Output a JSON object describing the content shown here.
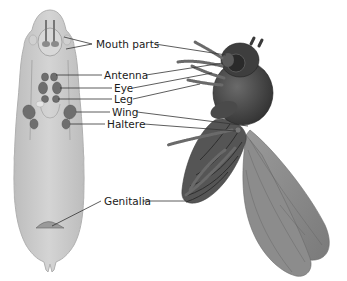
{
  "figure": {
    "type": "anatomical-diagram",
    "colors": {
      "background": "#ffffff",
      "larva_fill": "#c9c9c9",
      "larva_outline": "#b5b5b5",
      "organ_fill": "#6e6e6e",
      "fly_body": "#4a4a4a",
      "wing_fill": "#8a8a8a",
      "label_text": "#1a1a1a",
      "leader_line": "#333333"
    },
    "labels": [
      {
        "id": "mouth-parts",
        "text": "Mouth parts"
      },
      {
        "id": "antenna",
        "text": "Antenna"
      },
      {
        "id": "eye",
        "text": "Eye"
      },
      {
        "id": "leg",
        "text": "Leg"
      },
      {
        "id": "wing",
        "text": "Wing"
      },
      {
        "id": "haltere",
        "text": "Haltere"
      },
      {
        "id": "genitalia",
        "text": "Genitalia"
      }
    ]
  }
}
